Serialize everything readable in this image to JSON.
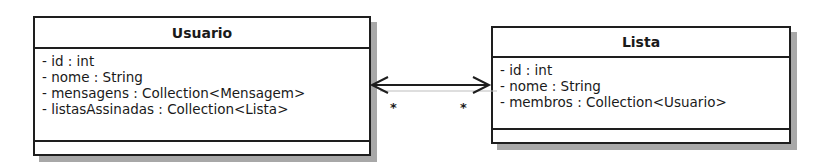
{
  "classes": [
    {
      "name": "Usuario",
      "attributes": [
        "- id : int",
        "- nome : String",
        "- mensagens : Collection<Mensagem>",
        "- listasAssinadas : Collection<Lista>"
      ],
      "operations": []
    },
    {
      "name": "Lista",
      "attributes": [
        "- id : int",
        "- nome : String",
        "- membros : Collection<Usuario>"
      ],
      "operations": []
    }
  ],
  "association": {
    "type": "bidirectional-navigable",
    "from": "Usuario",
    "to": "Lista",
    "multiplicity_usuario_end": "*",
    "multiplicity_lista_end": "*"
  }
}
